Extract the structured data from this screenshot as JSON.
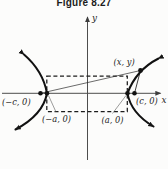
{
  "figure": {
    "title": "Figure 8.27"
  },
  "diagram": {
    "type": "hyperbola-definition-figure",
    "axis_labels": {
      "x": "x",
      "y": "y"
    },
    "labels": {
      "focus_left": "(−c, 0)",
      "vertex_left": "(−a, 0)",
      "vertex_right": "(a, 0)",
      "focus_right": "(c, 0)",
      "point_on_curve": "(x, y)"
    },
    "colors": {
      "ink": "#161616",
      "axis": "#4d4d4d",
      "background": "#fcfcfb"
    }
  }
}
